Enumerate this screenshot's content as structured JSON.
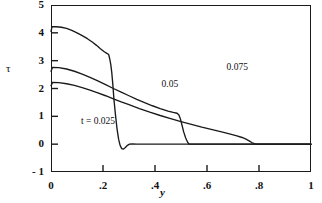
{
  "figure": {
    "background": "#ffffff",
    "line_color": "#1a1a1a",
    "frame": {
      "left": 51,
      "top": 5,
      "width": 260,
      "height": 167
    }
  },
  "axes": {
    "y_axis_label": "τ",
    "x_axis_label": "y",
    "y_ticks": [
      {
        "value": 5,
        "label": "5"
      },
      {
        "value": 4,
        "label": "4"
      },
      {
        "value": 3,
        "label": "3"
      },
      {
        "value": 2,
        "label": "2"
      },
      {
        "value": 1,
        "label": "1"
      },
      {
        "value": 0,
        "label": "0"
      },
      {
        "value": -1,
        "label": "- 1"
      }
    ],
    "x_ticks": [
      {
        "value": 0.0,
        "label": "0"
      },
      {
        "value": 0.2,
        "label": ".2"
      },
      {
        "value": 0.4,
        "label": ".4"
      },
      {
        "value": 0.6,
        "label": ".6"
      },
      {
        "value": 0.8,
        "label": ".8"
      },
      {
        "value": 1.0,
        "label": "1"
      }
    ]
  },
  "annotations": [
    {
      "name": "label-t-0025",
      "text": "t = 0.025",
      "x": 0.115,
      "y": 0.3
    },
    {
      "name": "label-005",
      "text": "0.05",
      "x": 0.425,
      "y": 0.52
    },
    {
      "name": "label-0075",
      "text": "0.075",
      "x": 0.675,
      "y": 0.62
    }
  ],
  "chart_data": {
    "type": "line",
    "title": "",
    "xlabel": "y",
    "ylabel": "τ",
    "xlim": [
      0,
      1
    ],
    "ylim": [
      -1,
      5
    ],
    "grid": false,
    "legend": "inline-annotations",
    "series": [
      {
        "name": "t = 0.025",
        "color": "#1a1a1a",
        "points": [
          [
            0.0,
            4.05
          ],
          [
            0.004,
            4.22
          ],
          [
            0.02,
            4.22
          ],
          [
            0.04,
            4.2
          ],
          [
            0.06,
            4.16
          ],
          [
            0.08,
            4.09
          ],
          [
            0.1,
            4.0
          ],
          [
            0.12,
            3.9
          ],
          [
            0.14,
            3.79
          ],
          [
            0.16,
            3.66
          ],
          [
            0.175,
            3.55
          ],
          [
            0.19,
            3.43
          ],
          [
            0.205,
            3.32
          ],
          [
            0.215,
            3.26
          ],
          [
            0.222,
            3.22
          ],
          [
            0.226,
            3.06
          ],
          [
            0.23,
            2.86
          ],
          [
            0.234,
            2.55
          ],
          [
            0.238,
            2.12
          ],
          [
            0.242,
            1.62
          ],
          [
            0.248,
            1.05
          ],
          [
            0.254,
            0.55
          ],
          [
            0.26,
            0.18
          ],
          [
            0.266,
            -0.05
          ],
          [
            0.272,
            -0.16
          ],
          [
            0.278,
            -0.18
          ],
          [
            0.286,
            -0.12
          ],
          [
            0.294,
            -0.04
          ],
          [
            0.302,
            0.0
          ],
          [
            0.312,
            0.01
          ],
          [
            0.33,
            0.0
          ],
          [
            0.5,
            0.0
          ],
          [
            0.75,
            0.0
          ],
          [
            1.0,
            0.0
          ]
        ]
      },
      {
        "name": "0.05",
        "color": "#1a1a1a",
        "points": [
          [
            0.0,
            2.62
          ],
          [
            0.006,
            2.76
          ],
          [
            0.03,
            2.75
          ],
          [
            0.06,
            2.7
          ],
          [
            0.09,
            2.62
          ],
          [
            0.12,
            2.52
          ],
          [
            0.15,
            2.4
          ],
          [
            0.18,
            2.27
          ],
          [
            0.21,
            2.14
          ],
          [
            0.24,
            2.0
          ],
          [
            0.27,
            1.87
          ],
          [
            0.3,
            1.74
          ],
          [
            0.33,
            1.61
          ],
          [
            0.36,
            1.49
          ],
          [
            0.39,
            1.38
          ],
          [
            0.42,
            1.28
          ],
          [
            0.45,
            1.19
          ],
          [
            0.47,
            1.14
          ],
          [
            0.485,
            1.11
          ],
          [
            0.492,
            1.05
          ],
          [
            0.498,
            0.9
          ],
          [
            0.504,
            0.68
          ],
          [
            0.51,
            0.45
          ],
          [
            0.518,
            0.22
          ],
          [
            0.526,
            0.06
          ],
          [
            0.532,
            0.0
          ],
          [
            0.56,
            0.0
          ],
          [
            0.7,
            0.0
          ],
          [
            0.85,
            0.0
          ],
          [
            1.0,
            0.0
          ]
        ]
      },
      {
        "name": "0.075",
        "color": "#1a1a1a",
        "points": [
          [
            0.0,
            2.1
          ],
          [
            0.006,
            2.22
          ],
          [
            0.03,
            2.21
          ],
          [
            0.06,
            2.17
          ],
          [
            0.09,
            2.11
          ],
          [
            0.12,
            2.03
          ],
          [
            0.15,
            1.94
          ],
          [
            0.18,
            1.84
          ],
          [
            0.21,
            1.74
          ],
          [
            0.24,
            1.63
          ],
          [
            0.27,
            1.52
          ],
          [
            0.3,
            1.42
          ],
          [
            0.34,
            1.28
          ],
          [
            0.38,
            1.15
          ],
          [
            0.42,
            1.03
          ],
          [
            0.46,
            0.92
          ],
          [
            0.5,
            0.81
          ],
          [
            0.54,
            0.71
          ],
          [
            0.58,
            0.61
          ],
          [
            0.62,
            0.52
          ],
          [
            0.66,
            0.43
          ],
          [
            0.69,
            0.36
          ],
          [
            0.715,
            0.3
          ],
          [
            0.735,
            0.24
          ],
          [
            0.75,
            0.18
          ],
          [
            0.762,
            0.12
          ],
          [
            0.772,
            0.06
          ],
          [
            0.782,
            0.02
          ],
          [
            0.792,
            0.0
          ],
          [
            0.85,
            0.0
          ],
          [
            0.93,
            0.0
          ],
          [
            1.0,
            0.0
          ]
        ]
      }
    ]
  }
}
